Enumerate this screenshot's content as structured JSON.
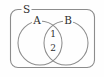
{
  "figure": {
    "type": "venn-diagram",
    "universal_set_label": "S",
    "set_labels": {
      "left": "A",
      "right": "B"
    },
    "intersection_items": [
      "1",
      "2"
    ],
    "colors": {
      "background": "#fefefe",
      "stroke": "#8c8c8c",
      "text": "#2e2e2e"
    }
  }
}
